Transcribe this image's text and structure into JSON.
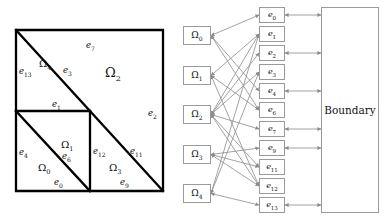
{
  "figure": {
    "colors": {
      "mesh_stroke": "#000000",
      "node_stroke": "#9a9a9a",
      "edge_stroke": "#8c8c8c",
      "background": "#ffffff",
      "text": "#111111"
    }
  },
  "mesh": {
    "name": "unit-square-triangulation",
    "square": {
      "x": 16,
      "y": 30,
      "w": 147,
      "h": 161
    },
    "subdomains": [
      {
        "id": "Omega0",
        "symbol": "Ω",
        "sub": "0",
        "x": 38,
        "y": 163,
        "size": "small"
      },
      {
        "id": "Omega1",
        "symbol": "Ω",
        "sub": "1",
        "x": 61,
        "y": 140,
        "size": "small"
      },
      {
        "id": "Omega2",
        "symbol": "Ω",
        "sub": "2",
        "x": 105,
        "y": 66,
        "size": "big"
      },
      {
        "id": "Omega3",
        "symbol": "Ω",
        "sub": "3",
        "x": 109,
        "y": 163,
        "size": "small"
      },
      {
        "id": "Omega4",
        "symbol": "Ω",
        "sub": "4",
        "x": 39,
        "y": 59,
        "size": "small"
      }
    ],
    "edge_labels": [
      {
        "id": "e0",
        "symbol": "e",
        "sub": "0",
        "x": 54,
        "y": 178
      },
      {
        "id": "e1",
        "symbol": "e",
        "sub": "1",
        "x": 52,
        "y": 100
      },
      {
        "id": "e2",
        "symbol": "e",
        "sub": "2",
        "x": 148,
        "y": 109
      },
      {
        "id": "e3",
        "symbol": "e",
        "sub": "3",
        "x": 63,
        "y": 66
      },
      {
        "id": "e4",
        "symbol": "e",
        "sub": "4",
        "x": 19,
        "y": 148
      },
      {
        "id": "e6",
        "symbol": "e",
        "sub": "6",
        "x": 62,
        "y": 152
      },
      {
        "id": "e7",
        "symbol": "e",
        "sub": "7",
        "x": 86,
        "y": 41
      },
      {
        "id": "e9",
        "symbol": "e",
        "sub": "9",
        "x": 120,
        "y": 178
      },
      {
        "id": "e11",
        "symbol": "e",
        "sub": "11",
        "x": 130,
        "y": 147
      },
      {
        "id": "e12",
        "symbol": "e",
        "sub": "12",
        "x": 93,
        "y": 147
      },
      {
        "id": "e13",
        "symbol": "e",
        "sub": "13",
        "x": 19,
        "y": 67
      }
    ],
    "segments": {
      "outer_square": [
        [
          16,
          30
        ],
        [
          163,
          30
        ],
        [
          163,
          191
        ],
        [
          16,
          191
        ]
      ],
      "main_diagonal": [
        [
          16,
          30
        ],
        [
          163,
          191
        ]
      ],
      "horizontal_mid": [
        [
          16,
          111
        ],
        [
          90,
          111
        ]
      ],
      "vertical_mid": [
        [
          90,
          111
        ],
        [
          90,
          191
        ]
      ],
      "lower_left_diagonal": [
        [
          16,
          111
        ],
        [
          90,
          191
        ]
      ]
    }
  },
  "graph": {
    "name": "bipartite-connectivity-graph",
    "omega_nodes": [
      {
        "id": "Omega0",
        "symbol": "Ω",
        "sub": "0",
        "x": 183,
        "y": 26,
        "w": 28,
        "h": 19
      },
      {
        "id": "Omega1",
        "symbol": "Ω",
        "sub": "1",
        "x": 183,
        "y": 66,
        "w": 28,
        "h": 19
      },
      {
        "id": "Omega2",
        "symbol": "Ω",
        "sub": "2",
        "x": 183,
        "y": 105,
        "w": 28,
        "h": 19
      },
      {
        "id": "Omega3",
        "symbol": "Ω",
        "sub": "3",
        "x": 183,
        "y": 145,
        "w": 28,
        "h": 19
      },
      {
        "id": "Omega4",
        "symbol": "Ω",
        "sub": "4",
        "x": 183,
        "y": 184,
        "w": 28,
        "h": 19
      }
    ],
    "edge_nodes": [
      {
        "id": "e0",
        "symbol": "e",
        "sub": "0",
        "x": 259,
        "y": 7,
        "w": 26,
        "h": 16
      },
      {
        "id": "e1",
        "symbol": "e",
        "sub": "1",
        "x": 259,
        "y": 26,
        "w": 26,
        "h": 16
      },
      {
        "id": "e2",
        "symbol": "e",
        "sub": "2",
        "x": 259,
        "y": 45,
        "w": 26,
        "h": 16
      },
      {
        "id": "e3",
        "symbol": "e",
        "sub": "3",
        "x": 259,
        "y": 64,
        "w": 26,
        "h": 16
      },
      {
        "id": "e4",
        "symbol": "e",
        "sub": "4",
        "x": 259,
        "y": 83,
        "w": 26,
        "h": 16
      },
      {
        "id": "e6",
        "symbol": "e",
        "sub": "6",
        "x": 259,
        "y": 102,
        "w": 26,
        "h": 16
      },
      {
        "id": "e7",
        "symbol": "e",
        "sub": "7",
        "x": 259,
        "y": 121,
        "w": 26,
        "h": 16
      },
      {
        "id": "e9",
        "symbol": "e",
        "sub": "9",
        "x": 259,
        "y": 140,
        "w": 26,
        "h": 16
      },
      {
        "id": "e11",
        "symbol": "e",
        "sub": "11",
        "x": 259,
        "y": 159,
        "w": 26,
        "h": 16
      },
      {
        "id": "e12",
        "symbol": "e",
        "sub": "12",
        "x": 259,
        "y": 178,
        "w": 26,
        "h": 16
      },
      {
        "id": "e13",
        "symbol": "e",
        "sub": "13",
        "x": 259,
        "y": 197,
        "w": 26,
        "h": 16
      }
    ],
    "boundary_node": {
      "id": "Boundary",
      "label": "Boundary",
      "x": 321,
      "y": 7,
      "w": 58,
      "h": 206
    },
    "omega_edge_links": [
      [
        "Omega0",
        "e0"
      ],
      [
        "Omega0",
        "e4"
      ],
      [
        "Omega0",
        "e6"
      ],
      [
        "Omega1",
        "e1"
      ],
      [
        "Omega1",
        "e6"
      ],
      [
        "Omega1",
        "e12"
      ],
      [
        "Omega2",
        "e1"
      ],
      [
        "Omega2",
        "e2"
      ],
      [
        "Omega2",
        "e3"
      ],
      [
        "Omega2",
        "e7"
      ],
      [
        "Omega2",
        "e11"
      ],
      [
        "Omega2",
        "e12"
      ],
      [
        "Omega3",
        "e9"
      ],
      [
        "Omega3",
        "e11"
      ],
      [
        "Omega3",
        "e12"
      ],
      [
        "Omega4",
        "e1"
      ],
      [
        "Omega4",
        "e3"
      ],
      [
        "Omega4",
        "e13"
      ]
    ],
    "boundary_links": [
      "e0",
      "e2",
      "e4",
      "e7",
      "e9",
      "e13"
    ]
  }
}
